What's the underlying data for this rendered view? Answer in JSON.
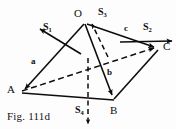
{
  "figure": {
    "caption": "Fig. 111d",
    "type": "tetrahedron-vector-diagram",
    "background_color": "#fdfdfd",
    "ink_color": "#0d0d0d"
  },
  "vertices": [
    {
      "id": "O",
      "label": "O",
      "x": 84,
      "y": 22,
      "label_x": 74,
      "label_y": 8
    },
    {
      "id": "A",
      "label": "A",
      "x": 21,
      "y": 92,
      "label_x": 7,
      "label_y": 86
    },
    {
      "id": "B",
      "label": "B",
      "x": 113,
      "y": 100,
      "label_x": 110,
      "label_y": 104
    },
    {
      "id": "C",
      "label": "C",
      "x": 158,
      "y": 48,
      "label_x": 162,
      "label_y": 42
    }
  ],
  "edges": [
    {
      "id": "OA",
      "from": "O",
      "to": "A",
      "style": "solid",
      "arrow": true
    },
    {
      "id": "OB",
      "from": "O",
      "to": "B",
      "style": "solid",
      "arrow": true
    },
    {
      "id": "OC",
      "from": "O",
      "to": "C",
      "style": "solid",
      "arrow": true
    },
    {
      "id": "AB",
      "from": "A",
      "to": "B",
      "style": "solid",
      "arrow": false
    },
    {
      "id": "BC",
      "from": "B",
      "to": "C",
      "style": "solid",
      "arrow": false
    },
    {
      "id": "AC",
      "from": "A",
      "to": "C",
      "style": "dashed",
      "arrow": true
    }
  ],
  "vectors": [
    {
      "id": "a",
      "label": "a",
      "edge": "OA",
      "label_x": 31,
      "label_y": 58
    },
    {
      "id": "b",
      "label": "b",
      "edge": "OB",
      "label_x": 107,
      "label_y": 70
    },
    {
      "id": "c",
      "label": "c",
      "edge": "OC",
      "label_x": 124,
      "label_y": 26
    }
  ],
  "normals": [
    {
      "id": "S1",
      "label": "S",
      "subscript": "1",
      "face": "OAB",
      "label_x": 43,
      "label_y": 24,
      "style": "solid",
      "direction": "down-left"
    },
    {
      "id": "S2",
      "label": "S",
      "subscript": "2",
      "face": "OBC",
      "label_x": 143,
      "label_y": 24,
      "style": "solid",
      "direction": "right"
    },
    {
      "id": "S3",
      "label": "S",
      "subscript": "3",
      "face": "OAC",
      "label_x": 98,
      "label_y": 8,
      "style": "dashed",
      "direction": "up-right"
    },
    {
      "id": "S4",
      "label": "S",
      "subscript": "4",
      "face": "ABC",
      "label_x": 76,
      "label_y": 106,
      "style": "dashed",
      "direction": "down"
    }
  ]
}
